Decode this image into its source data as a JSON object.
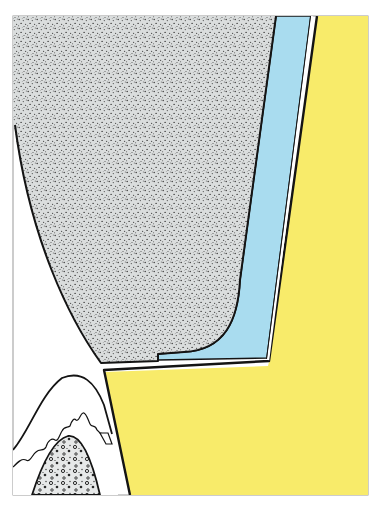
{
  "figure": {
    "type": "anatomical-cross-section",
    "labels": [],
    "colors": {
      "background": "#ffffff",
      "frame": "#9a9a9a",
      "outline": "#141414",
      "stippled_region": "#d9dcdc",
      "stipple_dots": "#3a3a3a",
      "blue_layer": "#a9dcef",
      "yellow_region": "#f8eb6a",
      "bone_fill": "#e4e6e6"
    },
    "regions": [
      {
        "name": "stippled-crown",
        "color": "#d9dcdc"
      },
      {
        "name": "blue-layer",
        "color": "#a9dcef"
      },
      {
        "name": "white-gap-line",
        "color": "#ffffff"
      },
      {
        "name": "yellow-region",
        "color": "#f8eb6a"
      },
      {
        "name": "gingiva",
        "color": "#ffffff"
      },
      {
        "name": "bone-crest",
        "color": "#e4e6e6"
      }
    ]
  }
}
